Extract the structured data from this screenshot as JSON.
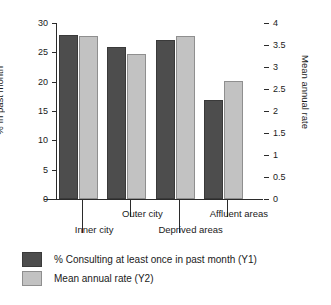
{
  "chart_data": {
    "type": "bar",
    "title": "",
    "xlabel": "",
    "categories": [
      "Inner city",
      "Outer city",
      "Deprived areas",
      "Affluent areas"
    ],
    "series": [
      {
        "name": "% Consulting at least once in past month (Y1)",
        "axis": "left",
        "color": "#4d4d4d",
        "values": [
          28.0,
          25.9,
          27.1,
          16.9
        ]
      },
      {
        "name": "Mean annual rate (Y2)",
        "axis": "right",
        "color": "#c2c2c2",
        "values": [
          3.7,
          3.29,
          3.71,
          2.68
        ]
      }
    ],
    "left_axis": {
      "label": "% In past month",
      "ticks": [
        "0",
        "5",
        "10",
        "15",
        "20",
        "25",
        "30"
      ],
      "tick_values": [
        0,
        5,
        10,
        15,
        20,
        25,
        30
      ],
      "ylim": [
        0,
        30
      ]
    },
    "right_axis": {
      "label": "Mean annual rate",
      "ticks": [
        "0",
        "0.5",
        "1",
        "1.5",
        "2",
        "2.5",
        "3",
        "3.5",
        "4"
      ],
      "tick_values": [
        0,
        0.5,
        1,
        1.5,
        2,
        2.5,
        3,
        3.5,
        4
      ],
      "ylim": [
        0,
        4
      ]
    },
    "grid": false,
    "legend_position": "bottom-left",
    "legend": [
      "% Consulting at least once in past month (Y1)",
      "Mean annual rate (Y2)"
    ]
  },
  "legend": {
    "items": [
      {
        "label": "% Consulting at least once in past month (Y1)",
        "swatch": "y1"
      },
      {
        "label": "Mean annual rate (Y2)",
        "swatch": "y2"
      }
    ]
  }
}
